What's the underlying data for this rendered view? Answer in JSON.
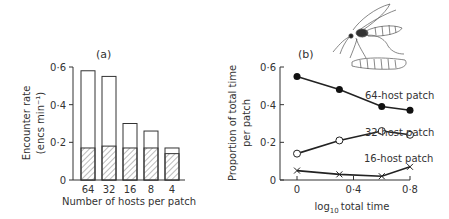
{
  "figure": {
    "panel_a_label": "(a)",
    "panel_b_label": "(b)",
    "illustration": "parasitoid-wasp-ovipositing-on-larva"
  },
  "chart_data": [
    {
      "type": "bar",
      "panel": "(a)",
      "title": "(a)",
      "xlabel": "Number of hosts per patch",
      "ylabel_line1": "Encounter rate",
      "ylabel_line2": "(encs min⁻¹)",
      "categories": [
        "64",
        "32",
        "16",
        "8",
        "4"
      ],
      "series": [
        {
          "name": "total",
          "style": "open",
          "values": [
            0.58,
            0.55,
            0.3,
            0.26,
            0.17
          ]
        },
        {
          "name": "hatched",
          "style": "hatched",
          "values": [
            0.17,
            0.18,
            0.17,
            0.17,
            0.14
          ]
        }
      ],
      "yticks": [
        "0",
        "0·2",
        "0·4",
        "0·6"
      ],
      "ytick_values": [
        0,
        0.2,
        0.4,
        0.6
      ],
      "ylim": [
        0,
        0.6
      ],
      "grid": false,
      "legend": null
    },
    {
      "type": "line",
      "panel": "(b)",
      "title": "(b)",
      "xlabel": "log₁₀ total time",
      "xlabel_main": "total time",
      "xlabel_prefix": "log",
      "xlabel_sub": "10",
      "ylabel_line1": "Proportion of total time",
      "ylabel_line2": "per patch",
      "x": [
        0,
        0.3,
        0.6,
        0.8
      ],
      "xticks": [
        "0",
        "0·4",
        "0·8"
      ],
      "xtick_values": [
        0,
        0.4,
        0.8
      ],
      "yticks": [
        "0",
        "0·2",
        "0·4",
        "0·6"
      ],
      "ytick_values": [
        0,
        0.2,
        0.4,
        0.6
      ],
      "ylim": [
        0,
        0.6
      ],
      "xlim": [
        -0.1,
        0.85
      ],
      "grid": false,
      "series": [
        {
          "name": "64-host patch",
          "marker": "filled-circle",
          "values": [
            0.55,
            0.48,
            0.39,
            0.37
          ]
        },
        {
          "name": "32-host patch",
          "marker": "open-circle",
          "values": [
            0.14,
            0.21,
            0.26,
            0.24
          ]
        },
        {
          "name": "16-host patch",
          "marker": "cross",
          "values": [
            0.05,
            0.03,
            0.02,
            0.07
          ]
        }
      ],
      "annotations": [
        "64-host patch",
        "32-host patch",
        "16-host patch"
      ]
    }
  ]
}
